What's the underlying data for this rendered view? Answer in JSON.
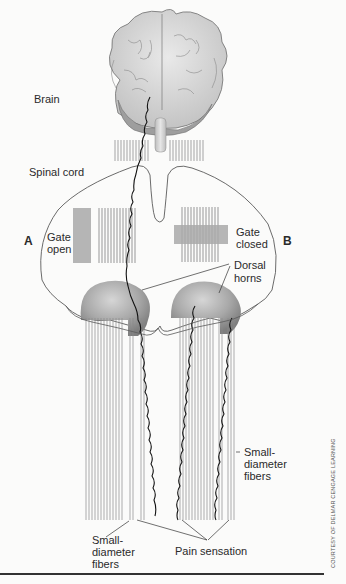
{
  "diagram": {
    "labels": {
      "brain": "Brain",
      "spinal_cord": "Spinal cord",
      "side_a": "A",
      "side_b": "B",
      "gate_open_1": "Gate",
      "gate_open_2": "open",
      "gate_closed_1": "Gate",
      "gate_closed_2": "closed",
      "dorsal_horns_1": "Dorsal",
      "dorsal_horns_2": "horns",
      "small_fibers_right_1": "Small-",
      "small_fibers_right_2": "diameter",
      "small_fibers_right_3": "fibers",
      "small_fibers_left_1": "Small-",
      "small_fibers_left_2": "diameter",
      "small_fibers_left_3": "fibers",
      "pain_sensation": "Pain sensation"
    },
    "credit": "COURTESY OF DELMAR CENGAGE LEARNING",
    "colors": {
      "outline": "#555555",
      "gate_fill": "#b5b5b5",
      "horn_fill": "#9a9a9a",
      "fiber_line": "#8a8a8a",
      "pain_fiber": "#111111",
      "brain_fill": "#dcdcdc"
    }
  }
}
